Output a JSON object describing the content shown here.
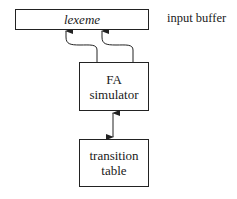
{
  "diagram": {
    "input_buffer": {
      "content": "lexeme",
      "label": "input buffer"
    },
    "fa_simulator": {
      "line1": "FA",
      "line2": "simulator"
    },
    "transition_table": {
      "line1": "transition",
      "line2": "table"
    },
    "edges": [
      {
        "from": "fa_simulator",
        "to": "input_buffer",
        "type": "curved-arrow",
        "role": "lexeme-begin pointer"
      },
      {
        "from": "fa_simulator",
        "to": "input_buffer",
        "type": "curved-arrow",
        "role": "forward pointer"
      },
      {
        "from": "fa_simulator",
        "to": "transition_table",
        "type": "bidirectional-arrow"
      }
    ]
  }
}
